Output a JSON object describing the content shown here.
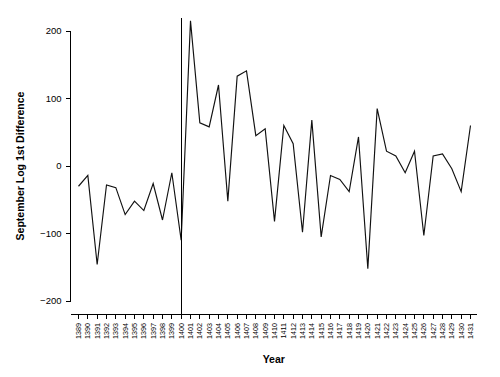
{
  "chart_data": {
    "type": "line",
    "title": "",
    "xlabel": "Year",
    "ylabel": "September Log 1st Difference",
    "xlim": [
      1389,
      1431
    ],
    "ylim": [
      -230,
      215
    ],
    "yticks": [
      -200,
      -100,
      0,
      100,
      200
    ],
    "ytick_labels": [
      "-200",
      "-100",
      "0",
      "100",
      "200"
    ],
    "grid": false,
    "legend": null,
    "annotations": [
      {
        "name": "intervention-vertical-line",
        "type": "vline",
        "x": 1400,
        "label": ""
      }
    ],
    "categories": [
      "1389",
      "1390",
      "1391",
      "1392",
      "1393",
      "1394",
      "1395",
      "1396",
      "1397",
      "1398",
      "1399",
      "1400",
      "1401",
      "1402",
      "1403",
      "1404",
      "1405",
      "1406",
      "1407",
      "1408",
      "1409",
      "1410",
      "1411",
      "1412",
      "1413",
      "1414",
      "1415",
      "1416",
      "1417",
      "1418",
      "1419",
      "1420",
      "1421",
      "1422",
      "1423",
      "1424",
      "1425",
      "1426",
      "1427",
      "1428",
      "1429",
      "1430",
      "1431"
    ],
    "x": [
      1389,
      1390,
      1391,
      1392,
      1393,
      1394,
      1395,
      1396,
      1397,
      1398,
      1399,
      1400,
      1401,
      1402,
      1403,
      1404,
      1405,
      1406,
      1407,
      1408,
      1409,
      1410,
      1411,
      1412,
      1413,
      1414,
      1415,
      1416,
      1417,
      1418,
      1419,
      1420,
      1421,
      1422,
      1423,
      1424,
      1425,
      1426,
      1427,
      1428,
      1429,
      1430,
      1431
    ],
    "values": [
      -30,
      -14,
      -146,
      -28,
      -32,
      -72,
      -52,
      -66,
      -26,
      -80,
      -10,
      -110,
      215,
      64,
      58,
      120,
      -52,
      133,
      141,
      45,
      55,
      -82,
      60,
      33,
      -98,
      68,
      -105,
      -14,
      -20,
      -38,
      43,
      -152,
      85,
      22,
      15,
      -10,
      22,
      -103,
      15,
      18,
      -4,
      -38,
      60
    ],
    "series": [
      {
        "name": "September Log 1st Difference",
        "color": "#111111",
        "values": [
          -30,
          -14,
          -146,
          -28,
          -32,
          -72,
          -52,
          -66,
          -26,
          -80,
          -10,
          -110,
          215,
          64,
          58,
          120,
          -52,
          133,
          141,
          45,
          55,
          -82,
          60,
          33,
          -98,
          68,
          -105,
          -14,
          -20,
          -38,
          43,
          -152,
          85,
          22,
          15,
          -10,
          22,
          -103,
          15,
          18,
          -4,
          -38,
          60
        ]
      }
    ]
  }
}
